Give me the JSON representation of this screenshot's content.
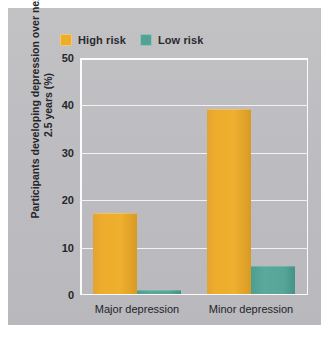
{
  "chart_data": {
    "type": "bar",
    "title": "",
    "xlabel": "",
    "ylabel": "Participants developing depression over next 2.5 years (%)",
    "categories": [
      "Major depression",
      "Minor depression"
    ],
    "series": [
      {
        "name": "High risk",
        "color": "#EEAC2C",
        "values": [
          17,
          39
        ]
      },
      {
        "name": "Low risk",
        "color": "#52A396",
        "values": [
          0.8,
          6
        ]
      }
    ],
    "ylim": [
      0,
      50
    ],
    "yticks": [
      0,
      10,
      20,
      30,
      40,
      50
    ],
    "ytick_labels": [
      "0",
      "10",
      "20",
      "30",
      "40",
      "50"
    ],
    "grid": true,
    "legend_position": "top-left"
  },
  "legend": {
    "entries": [
      {
        "label": "High risk",
        "color": "#EEAC2C"
      },
      {
        "label": "Low risk",
        "color": "#52A396"
      }
    ]
  },
  "axis": {
    "y_title": "Participants developing depression over next 2.5 years (%)",
    "y_ticks": [
      "0",
      "10",
      "20",
      "30",
      "40",
      "50"
    ],
    "x_ticks": [
      "Major depression",
      "Minor depression"
    ]
  },
  "colors": {
    "panel_background": "#BFBFC2",
    "page_background": "#FFFFFF",
    "gridline": "#F2F2F2",
    "high_risk": "#EEAC2C",
    "low_risk": "#52A396",
    "text": "#26262A"
  }
}
